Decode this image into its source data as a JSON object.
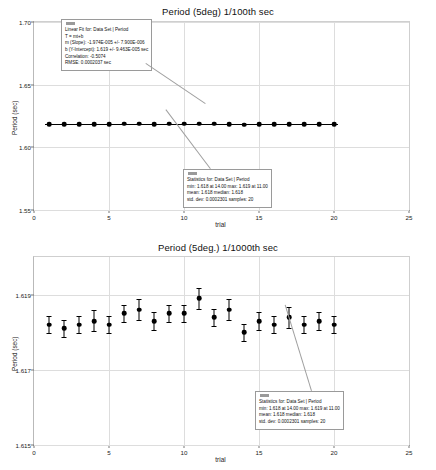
{
  "chart_data": [
    {
      "type": "scatter",
      "id": "period-100th",
      "title": "Period (5deg) 1/100th sec",
      "xlabel": "trial",
      "ylabel": "Period (sec)",
      "xlim": [
        0,
        25
      ],
      "ylim": [
        1.55,
        1.7
      ],
      "xticks": [
        0,
        5,
        10,
        15,
        20,
        25
      ],
      "xtick_labels": [
        "0",
        "5",
        "10",
        "15",
        "20",
        "25"
      ],
      "yticks": [
        1.55,
        1.6,
        1.65,
        1.7
      ],
      "ytick_labels": [
        "1.55",
        "1.60",
        "1.65",
        "1.70"
      ],
      "grid": true,
      "legend": "none",
      "x": [
        1,
        2,
        3,
        4,
        5,
        6,
        7,
        8,
        9,
        10,
        11,
        12,
        13,
        14,
        15,
        16,
        17,
        18,
        19,
        20
      ],
      "values": [
        1.6186,
        1.6185,
        1.6186,
        1.6186,
        1.6186,
        1.6187,
        1.6187,
        1.6186,
        1.6187,
        1.6187,
        1.619,
        1.6187,
        1.6186,
        1.618,
        1.6184,
        1.6183,
        1.6184,
        1.6183,
        1.6184,
        1.6183
      ],
      "fit_line": {
        "label": "linear fit",
        "slope": -1.974e-05,
        "intercept": 1.619
      }
    },
    {
      "type": "scatter",
      "id": "period-1000th",
      "title": "Period (5deg.) 1/1000th sec",
      "xlabel": "trial",
      "ylabel": "Period (sec)",
      "xlim": [
        0,
        25
      ],
      "ylim": [
        1.615,
        1.62
      ],
      "xticks": [
        0,
        5,
        10,
        15,
        20,
        25
      ],
      "xtick_labels": [
        "0",
        "5",
        "10",
        "15",
        "20",
        "25"
      ],
      "yticks": [
        1.615,
        1.617,
        1.619
      ],
      "ytick_labels": [
        "1.615",
        "1.617",
        "1.619"
      ],
      "grid": true,
      "legend": "none",
      "x": [
        1,
        2,
        3,
        4,
        5,
        6,
        7,
        8,
        9,
        10,
        11,
        12,
        13,
        14,
        15,
        16,
        17,
        18,
        19,
        20
      ],
      "values": [
        1.6182,
        1.6181,
        1.6182,
        1.6183,
        1.6182,
        1.6185,
        1.6186,
        1.6183,
        1.6185,
        1.6185,
        1.6189,
        1.6184,
        1.6186,
        1.618,
        1.6183,
        1.6182,
        1.6184,
        1.6182,
        1.6183,
        1.6182
      ],
      "errors": [
        0.00023,
        0.00023,
        0.00023,
        0.00028,
        0.00023,
        0.00023,
        0.00028,
        0.00023,
        0.00023,
        0.00023,
        0.00028,
        0.00023,
        0.00028,
        0.00023,
        0.00023,
        0.00023,
        0.00028,
        0.00023,
        0.00023,
        0.00023
      ]
    }
  ],
  "chart1": {
    "title": "Period (5deg) 1/100th sec",
    "xlabel": "trial",
    "ylabel": "Period (sec)",
    "fit_box": {
      "line1": "Linear Fit for: Data Set | Period",
      "line2": "T = mt+b",
      "line3": "m (Slope): -1.974E-005 +/- 7.900E-006",
      "line4": "b (Y-Intercept): 1.619 +/- 9.463E-005 sec",
      "line5": "Correlation: -0.5074",
      "line6": "RMSE: 0.0002037 sec"
    },
    "stats_box": {
      "line1": "Statistics for: Data Set | Period",
      "line2": "min: 1.618 at 14.00 max: 1.619 at 11.00",
      "line3": "mean: 1.618 median: 1.618",
      "line4": "std. dev: 0.0002301 samples: 20"
    }
  },
  "chart2": {
    "title": "Period (5deg.) 1/1000th sec",
    "xlabel": "trial",
    "ylabel": "Period (sec)",
    "stats_box": {
      "line1": "Statistics for: Data Set | Period",
      "line2": "min: 1.618 at 14.00 max: 1.619 at 11.00",
      "line3": "mean: 1.618 median: 1.618",
      "line4": "std. dev: 0.0002301 samples: 20"
    }
  },
  "colors": {
    "marker": "#000000",
    "grid": "#dddddd",
    "frame": "#b9b9b9",
    "callout_border": "#9a9a9a"
  }
}
